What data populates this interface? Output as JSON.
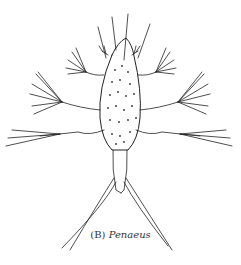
{
  "figure": {
    "caption_label": "(B)",
    "caption_genus": "Penaeus",
    "colors": {
      "ink": "#222222",
      "background": "#ffffff"
    }
  }
}
